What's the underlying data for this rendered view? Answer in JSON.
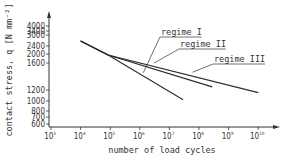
{
  "chart_data": {
    "type": "line",
    "title": "",
    "xlabel": "number of load cycles",
    "ylabel": "contact stress, q [N mm⁻²]",
    "xscale": "log",
    "yscale": "log",
    "xlim": [
      1000,
      10000000000
    ],
    "ylim": [
      600,
      4000
    ],
    "x_ticks": [
      {
        "value": 1000,
        "base": "10",
        "exp": "3"
      },
      {
        "value": 10000,
        "base": "10",
        "exp": "4"
      },
      {
        "value": 100000,
        "base": "10",
        "exp": "5"
      },
      {
        "value": 1000000,
        "base": "10",
        "exp": "6"
      },
      {
        "value": 10000000,
        "base": "10",
        "exp": "7"
      },
      {
        "value": 100000000,
        "base": "10",
        "exp": "8"
      },
      {
        "value": 1000000000,
        "base": "10",
        "exp": "9"
      },
      {
        "value": 10000000000,
        "base": "10",
        "exp": "10"
      }
    ],
    "y_ticks": [
      {
        "value": 4000,
        "label": "4000"
      },
      {
        "value": 3400,
        "label": "3400"
      },
      {
        "value": 3000,
        "label": "3000"
      },
      {
        "value": 2400,
        "label": "2400"
      },
      {
        "value": 2000,
        "label": "2000"
      },
      {
        "value": 1600,
        "label": "1600"
      },
      {
        "value": 1200,
        "label": "1200"
      },
      {
        "value": 1000,
        "label": "1000"
      },
      {
        "value": 800,
        "label": "800"
      },
      {
        "value": 700,
        "label": "700"
      },
      {
        "value": 600,
        "label": "600"
      }
    ],
    "grid": false,
    "legend": "none",
    "series": [
      {
        "name": "regime I",
        "points": [
          [
            10000,
            2650
          ],
          [
            85000,
            1950
          ],
          [
            29000000,
            1020
          ]
        ]
      },
      {
        "name": "regime II",
        "points": [
          [
            10000,
            2650
          ],
          [
            85000,
            1950
          ],
          [
            280000000,
            1240
          ]
        ]
      },
      {
        "name": "regime III",
        "points": [
          [
            10000,
            2650
          ],
          [
            85000,
            1950
          ],
          [
            10000000000,
            1150
          ]
        ]
      }
    ],
    "annotations": [
      {
        "text": "regime I",
        "series": "regime I",
        "at_x": 1300000
      },
      {
        "text": "regime II",
        "series": "regime II",
        "at_x": 3000000
      },
      {
        "text": "regime III",
        "series": "regime III",
        "at_x": 60000000
      }
    ]
  }
}
